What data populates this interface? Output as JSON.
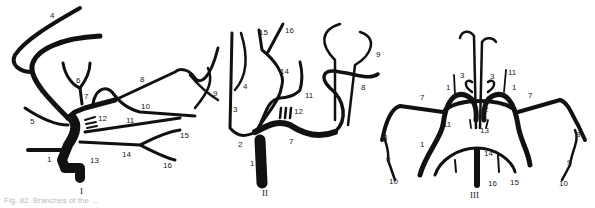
{
  "figure": {
    "caption": "Fig. 82. Branches of the ...",
    "panels": [
      {
        "numeral": "I",
        "labels": [
          "1",
          "3",
          "4",
          "5",
          "6",
          "7",
          "8",
          "9",
          "10",
          "11",
          "12",
          "13",
          "14",
          "15",
          "16"
        ]
      },
      {
        "numeral": "II",
        "labels": [
          "1",
          "2",
          "3",
          "4",
          "7",
          "8",
          "9",
          "11",
          "12",
          "14",
          "15",
          "16"
        ]
      },
      {
        "numeral": "III",
        "labels": [
          "1",
          "2",
          "3",
          "7",
          "8",
          "9",
          "10",
          "11",
          "13",
          "14",
          "15",
          "16"
        ]
      }
    ]
  }
}
